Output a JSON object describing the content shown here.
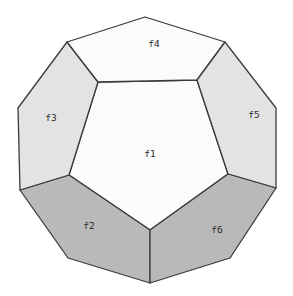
{
  "diagram": {
    "type": "polyhedron-net-projection",
    "colors": {
      "background": "#ffffff",
      "stroke": "#3a3a3a",
      "face_white": "#fbfbfb",
      "face_light": "#e3e3e3",
      "face_dark": "#b9b9b9",
      "label": "#2a2a2a"
    },
    "faces": [
      {
        "id": "f1",
        "label": "f1",
        "shade": "white",
        "points": "98,82 197,80 228,174 150,230 69,175",
        "label_pos": [
          150,
          157
        ]
      },
      {
        "id": "f2",
        "label": "f2",
        "shade": "dark",
        "points": "69,175 150,230 150,283 68,258 20,190",
        "label_pos": [
          89,
          229
        ]
      },
      {
        "id": "f3",
        "label": "f3",
        "shade": "light",
        "points": "67,42 98,82 69,175 20,190 18,108",
        "label_pos": [
          51,
          121
        ]
      },
      {
        "id": "f4",
        "label": "f4",
        "shade": "white",
        "points": "145,17 225,42 197,80 98,82 67,42",
        "label_pos": [
          154,
          47
        ]
      },
      {
        "id": "f5",
        "label": "f5",
        "shade": "light",
        "points": "225,42 276,108 276,188 228,174 197,80",
        "label_pos": [
          254,
          118
        ]
      },
      {
        "id": "f6",
        "label": "f6",
        "shade": "dark",
        "points": "228,174 276,188 230,258 150,283 150,230",
        "label_pos": [
          217,
          233
        ]
      }
    ]
  }
}
